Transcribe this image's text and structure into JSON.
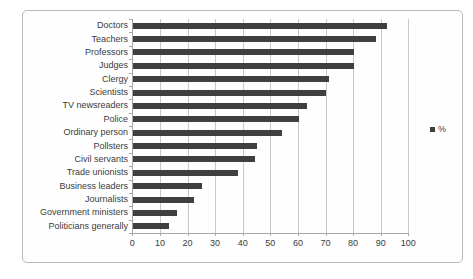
{
  "chart_data": {
    "type": "bar",
    "orientation": "horizontal",
    "title": "",
    "xlabel": "",
    "ylabel": "",
    "categories": [
      "Doctors",
      "Teachers",
      "Professors",
      "Judges",
      "Clergy",
      "Scientists",
      "TV newsreaders",
      "Police",
      "Ordinary person",
      "Pollsters",
      "Civil servants",
      "Trade unionists",
      "Business leaders",
      "Journalists",
      "Government ministers",
      "Politicians generally"
    ],
    "values": [
      92,
      88,
      80,
      80,
      71,
      70,
      63,
      60,
      54,
      45,
      44,
      38,
      25,
      22,
      16,
      13
    ],
    "xlim": [
      0,
      100
    ],
    "xticks": [
      0,
      10,
      20,
      30,
      40,
      50,
      60,
      70,
      80,
      90,
      100
    ],
    "grid": "vertical",
    "legend": {
      "label": "%",
      "position": "right"
    },
    "colors": {
      "bar": "#3f3f3f",
      "gridline": "#c9c9c9",
      "axis": "#a6a6a6",
      "text": "#3c3c3c",
      "frame_border": "#b9b9b9",
      "background": "#ffffff"
    }
  }
}
